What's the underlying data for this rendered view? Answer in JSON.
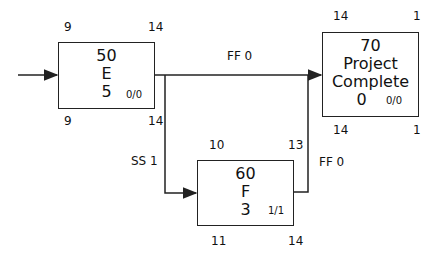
{
  "nodes": [
    {
      "id": "50",
      "name": "E",
      "duration": "5",
      "float": "0/0",
      "early_start": "9",
      "early_finish": "14",
      "late_start": "9",
      "late_finish": "14"
    },
    {
      "id": "60",
      "name": "F",
      "duration": "3",
      "float": "1/1",
      "early_start": "10",
      "early_finish": "13",
      "late_start": "11",
      "late_finish": "14"
    },
    {
      "id": "70",
      "name_line1": "Project",
      "name_line2": "Complete",
      "duration": "0",
      "float": "0/0",
      "early_start": "14",
      "early_finish": "1",
      "late_start": "14",
      "late_finish": "1"
    }
  ],
  "relationships": [
    {
      "from": "50",
      "to": "70",
      "label": "FF 0"
    },
    {
      "from": "50",
      "to": "60",
      "label": "SS 1"
    },
    {
      "from": "60",
      "to": "70",
      "label": "FF 0"
    }
  ],
  "colors": {
    "line": "#222222",
    "background": "#ffffff"
  }
}
